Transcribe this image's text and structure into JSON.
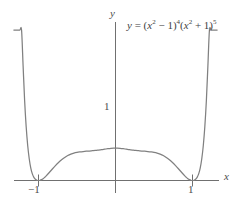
{
  "figure": {
    "title": "",
    "background": "#ffffff",
    "curve_color": "#808080",
    "axis_color": "#707070",
    "text_color": "#4d4d4d"
  },
  "labels": {
    "y_axis": "y",
    "x_axis": "x",
    "y_one": "1",
    "x_neg_one": "−1",
    "x_pos_one": "1"
  },
  "equation": {
    "lhs": "y",
    "equals": "=",
    "open1": "(",
    "base1": "x",
    "base1_exp": "2",
    "minus": "−",
    "one1": "1",
    "close1": ")",
    "power1": "4",
    "open2": "(",
    "base2": "x",
    "base2_exp": "2",
    "plus": "+",
    "one2": "1",
    "close2": ")",
    "power2": "5",
    "plain": "y = (x² − 1)⁴(x² + 1)⁵"
  },
  "chart_data": {
    "type": "line",
    "title": "",
    "xlabel": "x",
    "ylabel": "y",
    "expression": "y = (x^2 - 1)^4 (x^2 + 1)^5",
    "grid": false,
    "legend": null,
    "xlim": [
      -1.32,
      1.34
    ],
    "ylim": [
      -0.16,
      2.6
    ],
    "xticks": [
      -1,
      1
    ],
    "xticklabels": [
      "−1",
      "1"
    ],
    "yticks": [
      1
    ],
    "yticklabels": [
      "1"
    ],
    "annotations": [
      {
        "text": "y = (x² − 1)⁴(x² + 1)⁵",
        "x": 0.16,
        "y": 2.35
      }
    ],
    "features": {
      "zeros": [
        -1,
        1
      ],
      "zero_multiplicity": 4,
      "local_max_at_x_zero": 1,
      "humps_at_x": [
        -0.555,
        0.555
      ],
      "hump_value": 1.09,
      "symmetry": "even"
    },
    "x": [
      -1.32,
      -1.3,
      -1.28,
      -1.26,
      -1.24,
      -1.22,
      -1.2,
      -1.18,
      -1.16,
      -1.14,
      -1.12,
      -1.1,
      -1.08,
      -1.06,
      -1.04,
      -1.02,
      -1.0,
      -0.98,
      -0.96,
      -0.94,
      -0.92,
      -0.9,
      -0.86,
      -0.82,
      -0.78,
      -0.74,
      -0.7,
      -0.66,
      -0.62,
      -0.58,
      -0.54,
      -0.5,
      -0.46,
      -0.42,
      -0.38,
      -0.34,
      -0.3,
      -0.26,
      -0.22,
      -0.18,
      -0.14,
      -0.1,
      -0.06,
      -0.02,
      0.0,
      0.02,
      0.06,
      0.1,
      0.14,
      0.18,
      0.22,
      0.26,
      0.3,
      0.34,
      0.38,
      0.42,
      0.46,
      0.5,
      0.54,
      0.58,
      0.62,
      0.66,
      0.7,
      0.74,
      0.78,
      0.82,
      0.86,
      0.9,
      0.92,
      0.94,
      0.96,
      0.98,
      1.0,
      1.02,
      1.04,
      1.06,
      1.08,
      1.1,
      1.12,
      1.14,
      1.16,
      1.18,
      1.2,
      1.22,
      1.24,
      1.26,
      1.28,
      1.3,
      1.32
    ],
    "y": [
      8.32,
      6.51,
      5.03,
      3.83,
      2.87,
      2.1,
      1.51,
      1.05,
      0.707,
      0.458,
      0.283,
      0.164,
      0.0866,
      0.0404,
      0.0155,
      0.0035,
      0.0,
      0.003,
      0.0114,
      0.0244,
      0.0412,
      0.0608,
      0.105,
      0.151,
      0.195,
      0.236,
      0.272,
      0.303,
      0.328,
      0.347,
      0.361,
      0.37,
      0.376,
      0.381,
      0.385,
      0.388,
      0.392,
      0.396,
      0.401,
      0.406,
      0.412,
      0.418,
      0.423,
      0.426,
      0.427,
      0.426,
      0.423,
      0.418,
      0.412,
      0.406,
      0.401,
      0.396,
      0.392,
      0.388,
      0.385,
      0.381,
      0.376,
      0.37,
      0.361,
      0.347,
      0.328,
      0.303,
      0.272,
      0.236,
      0.195,
      0.151,
      0.105,
      0.0608,
      0.0412,
      0.0244,
      0.0114,
      0.003,
      0.0,
      0.0035,
      0.0155,
      0.0404,
      0.0866,
      0.164,
      0.283,
      0.458,
      0.707,
      1.05,
      1.51,
      2.1,
      2.87,
      3.83,
      5.03,
      6.51,
      8.32
    ]
  }
}
